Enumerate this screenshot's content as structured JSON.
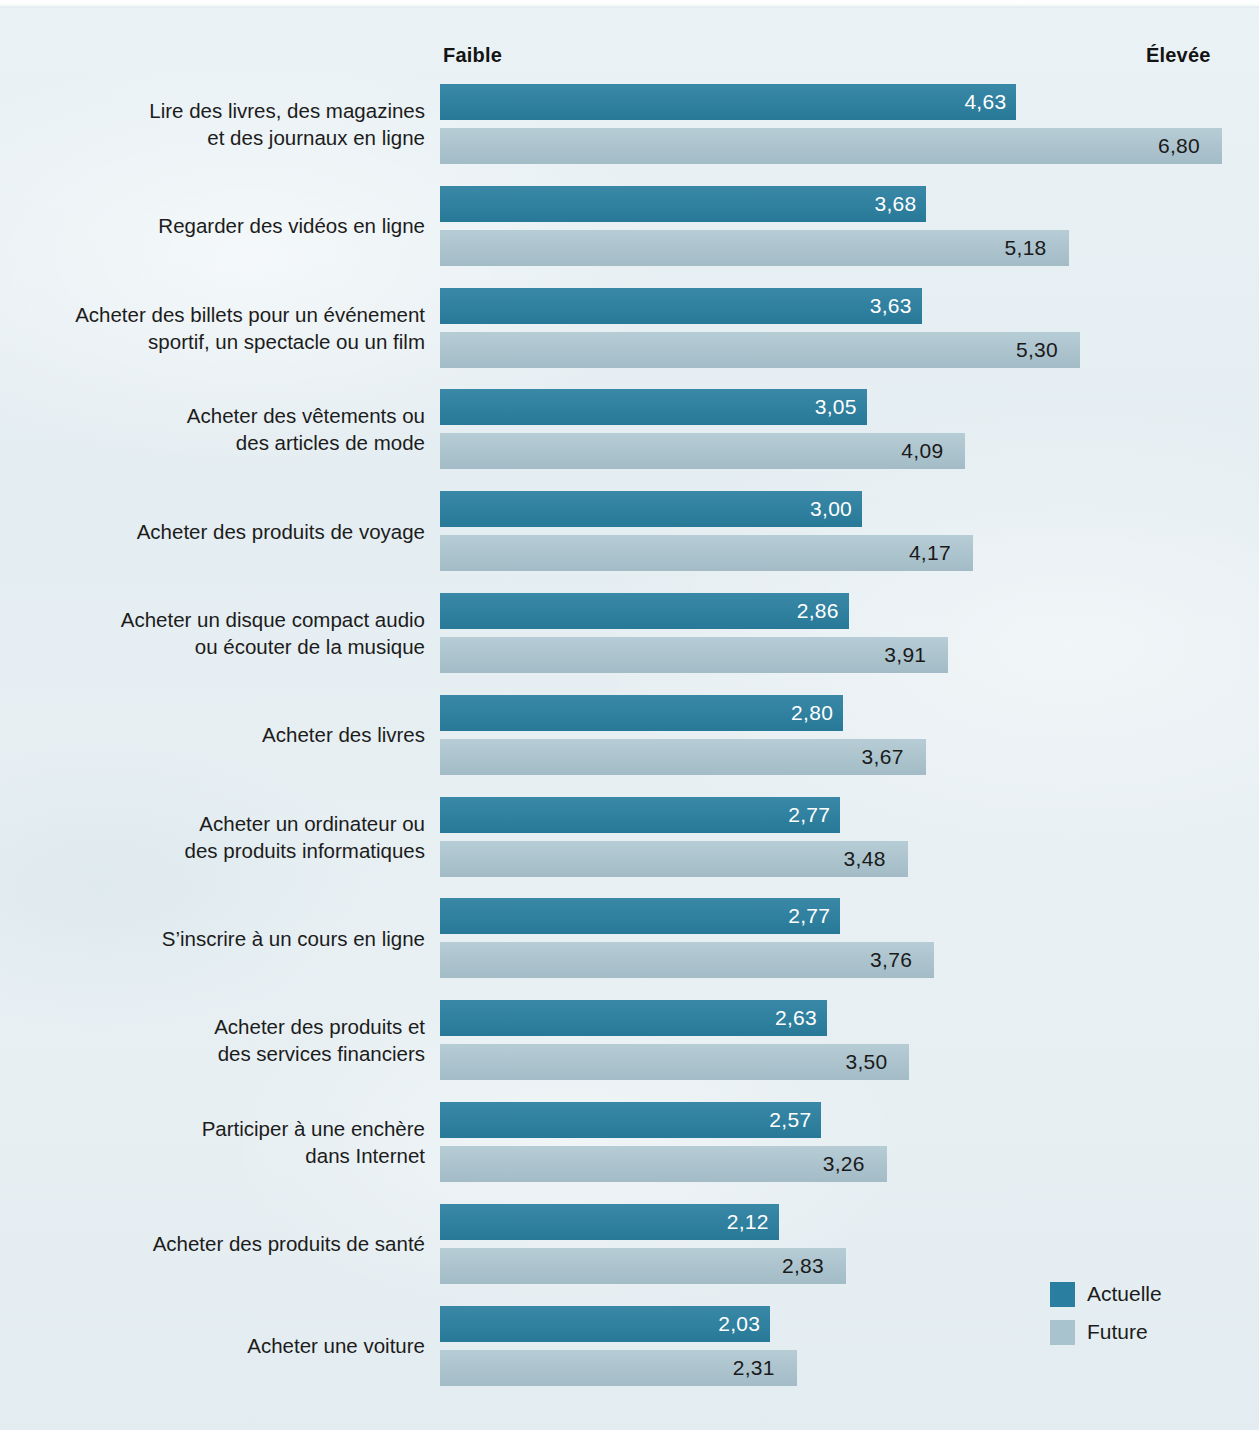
{
  "chart_data": {
    "type": "bar",
    "orientation": "horizontal",
    "title": "",
    "subtitle": "",
    "xlabel": "",
    "ylabel": "",
    "axis_low_label": "Faible",
    "axis_high_label": "Élevée",
    "xlim": [
      0,
      7
    ],
    "grid": false,
    "legend_position": "bottom-right",
    "series": [
      {
        "name": "Actuelle",
        "color": "#2a7fa0"
      },
      {
        "name": "Future",
        "color": "#a9c3ce"
      }
    ],
    "categories": [
      "Lire des livres, des magazines\net des journaux en ligne",
      "Regarder des vidéos en ligne",
      "Acheter des billets pour un événement\nsportif, un spectacle ou un film",
      "Acheter des vêtements ou\ndes articles de mode",
      "Acheter des produits de voyage",
      "Acheter un disque compact audio\nou écouter de la musique",
      "Acheter des livres",
      "Acheter un ordinateur ou\ndes produits informatiques",
      "S’inscrire à un cours en ligne",
      "Acheter des produits et\ndes services financiers",
      "Participer à une enchère\ndans Internet",
      "Acheter des produits de santé",
      "Acheter une voiture"
    ],
    "values_actuelle": [
      4.63,
      3.68,
      3.63,
      3.05,
      3.0,
      2.86,
      2.8,
      2.77,
      2.77,
      2.63,
      2.57,
      2.12,
      2.03
    ],
    "values_future": [
      6.8,
      5.18,
      5.3,
      4.09,
      4.17,
      3.91,
      3.67,
      3.48,
      3.76,
      3.5,
      3.26,
      2.83,
      2.31
    ],
    "labels_actuelle": [
      "4,63",
      "3,68",
      "3,63",
      "3,05",
      "3,00",
      "2,86",
      "2,80",
      "2,77",
      "2,77",
      "2,63",
      "2,57",
      "2,12",
      "2,03"
    ],
    "labels_future": [
      "6,80",
      "5,18",
      "5,30",
      "4,09",
      "4,17",
      "3,91",
      "3,67",
      "3,48",
      "3,76",
      "3,50",
      "3,26",
      "2,83",
      "2,31"
    ]
  },
  "axis": {
    "low": "Faible",
    "high": "Élevée"
  },
  "legend": {
    "items": [
      {
        "label": "Actuelle",
        "color": "#2a7fa0"
      },
      {
        "label": "Future",
        "color": "#a9c3ce"
      }
    ]
  },
  "colors": {
    "background": "#e6eff2",
    "current_bar": "#2a7fa0",
    "future_bar": "#a9c3ce",
    "text": "#1c1c1c",
    "value_inside": "#ffffff"
  }
}
